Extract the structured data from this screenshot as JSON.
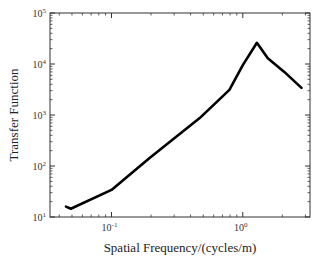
{
  "chart_data": {
    "type": "line",
    "title": "",
    "xlabel": "Spatial Frequency/(cycles/m)",
    "ylabel": "Transfer Function",
    "xscale": "log",
    "yscale": "log",
    "xlim": [
      0.034,
      3.25
    ],
    "ylim": [
      10,
      100000
    ],
    "x_ticks": [
      {
        "base": "10",
        "exp": "-1",
        "value": 0.1
      },
      {
        "base": "10",
        "exp": "0",
        "value": 1
      }
    ],
    "y_ticks": [
      {
        "base": "10",
        "exp": "1",
        "value": 10
      },
      {
        "base": "10",
        "exp": "2",
        "value": 100
      },
      {
        "base": "10",
        "exp": "3",
        "value": 1000
      },
      {
        "base": "10",
        "exp": "4",
        "value": 10000
      },
      {
        "base": "10",
        "exp": "5",
        "value": 100000
      }
    ],
    "grid": false,
    "legend": null,
    "series": [
      {
        "name": "Transfer Function",
        "color": "#000000",
        "x": [
          0.045,
          0.049,
          0.1,
          0.195,
          0.47,
          0.79,
          1.0,
          1.28,
          1.55,
          2.07,
          2.8
        ],
        "y": [
          16,
          14.5,
          34,
          144,
          870,
          3100,
          9500,
          26000,
          13000,
          7000,
          3400
        ]
      }
    ]
  }
}
